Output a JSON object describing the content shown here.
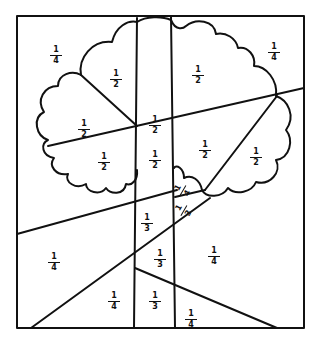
{
  "diagram": {
    "stroke_color": "#111111",
    "background": "#ffffff",
    "regions": [
      {
        "id": "top-left",
        "num": "1",
        "den": "4",
        "x": 48,
        "y": 46
      },
      {
        "id": "crown-left-upper",
        "num": "1",
        "den": "2",
        "x": 108,
        "y": 70
      },
      {
        "id": "crown-left-mid",
        "num": "1",
        "den": "2",
        "x": 76,
        "y": 120
      },
      {
        "id": "trunk-top",
        "num": "1",
        "den": "2",
        "x": 147,
        "y": 116
      },
      {
        "id": "crown-right-upper",
        "num": "1",
        "den": "2",
        "x": 190,
        "y": 66
      },
      {
        "id": "top-right",
        "num": "1",
        "den": "4",
        "x": 266,
        "y": 43
      },
      {
        "id": "crown-left-lower",
        "num": "1",
        "den": "2",
        "x": 96,
        "y": 153
      },
      {
        "id": "trunk-mid",
        "num": "1",
        "den": "2",
        "x": 147,
        "y": 151
      },
      {
        "id": "crown-right-center",
        "num": "1",
        "den": "2",
        "x": 197,
        "y": 141
      },
      {
        "id": "crown-right-lower",
        "num": "1",
        "den": "2",
        "x": 248,
        "y": 148
      },
      {
        "id": "fork-upper",
        "num": "1",
        "den": "4",
        "x": 175,
        "y": 181,
        "rotated": true
      },
      {
        "id": "fork-lower",
        "num": "1",
        "den": "3",
        "x": 176,
        "y": 201,
        "rotated": true
      },
      {
        "id": "trunk-lower-a",
        "num": "1",
        "den": "3",
        "x": 139,
        "y": 214
      },
      {
        "id": "bottom-left",
        "num": "1",
        "den": "4",
        "x": 46,
        "y": 253
      },
      {
        "id": "trunk-lower-b",
        "num": "1",
        "den": "3",
        "x": 152,
        "y": 250
      },
      {
        "id": "right-lower",
        "num": "1",
        "den": "4",
        "x": 206,
        "y": 247
      },
      {
        "id": "bottom-center-left",
        "num": "1",
        "den": "4",
        "x": 106,
        "y": 292
      },
      {
        "id": "trunk-bottom",
        "num": "1",
        "den": "3",
        "x": 147,
        "y": 292
      },
      {
        "id": "bottom-right",
        "num": "1",
        "den": "4",
        "x": 183,
        "y": 310
      }
    ]
  }
}
